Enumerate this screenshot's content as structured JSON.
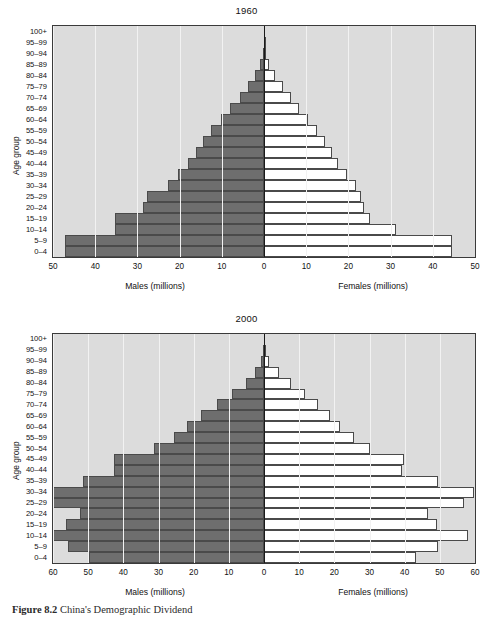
{
  "figure": {
    "caption_label": "Figure 8.2",
    "caption_text": "China's Demographic Dividend"
  },
  "axis_titles": {
    "y": "Age group",
    "males": "Males (millions)",
    "females": "Females (millions)"
  },
  "age_groups": [
    "100+",
    "95–99",
    "90–94",
    "85–89",
    "80–84",
    "75–79",
    "70–74",
    "65–69",
    "60–64",
    "55–59",
    "50–54",
    "45–49",
    "40–44",
    "35–39",
    "30–34",
    "25–29",
    "20–24",
    "15–19",
    "10–14",
    "5–9",
    "0–4"
  ],
  "colors": {
    "male_bar": "#6e6e6e",
    "female_bar": "#ffffff",
    "plot_background": "#dcdcdc",
    "gridline": "#f2f2f2",
    "axis": "#1a1a1a",
    "page_background": "#ffffff"
  },
  "chart_data": [
    {
      "type": "bar",
      "title": "1960",
      "xlabel": "",
      "ylabel": "Age group",
      "orientation": "population-pyramid",
      "grid": true,
      "legend": "none",
      "xlim": [
        -50,
        50
      ],
      "xticks": [
        50,
        40,
        30,
        20,
        10,
        0,
        10,
        20,
        30,
        40,
        50
      ],
      "xtick_values": [
        -50,
        -40,
        -30,
        -20,
        -10,
        0,
        10,
        20,
        30,
        40,
        50
      ],
      "categories": [
        "100+",
        "95–99",
        "90–94",
        "85–89",
        "80–84",
        "75–79",
        "70–74",
        "65–69",
        "60–64",
        "55–59",
        "50–54",
        "45–49",
        "40–44",
        "35–39",
        "30–34",
        "25–29",
        "20–24",
        "15–19",
        "10–14",
        "5–9",
        "0–4"
      ],
      "series": [
        {
          "name": "Males (millions)",
          "side": "left",
          "values": [
            0.0,
            0.1,
            0.3,
            0.9,
            2.1,
            3.8,
            5.8,
            8.0,
            10.3,
            12.6,
            14.5,
            16.2,
            18.0,
            20.4,
            22.8,
            27.7,
            28.6,
            35.3,
            35.3,
            47.2,
            47.2
          ]
        },
        {
          "name": "Females (millions)",
          "side": "right",
          "values": [
            0.0,
            0.1,
            0.4,
            1.2,
            2.6,
            4.4,
            6.3,
            8.3,
            10.4,
            12.5,
            14.4,
            16.0,
            17.5,
            19.6,
            21.8,
            23.0,
            23.7,
            25.0,
            31.3,
            44.6,
            44.6
          ]
        }
      ]
    },
    {
      "type": "bar",
      "title": "2000",
      "xlabel": "",
      "ylabel": "Age group",
      "orientation": "population-pyramid",
      "grid": true,
      "legend": "none",
      "xlim": [
        -60,
        60
      ],
      "xticks": [
        60,
        50,
        40,
        30,
        20,
        10,
        0,
        10,
        20,
        30,
        40,
        50,
        60
      ],
      "xtick_values": [
        -60,
        -50,
        -40,
        -30,
        -20,
        -10,
        0,
        10,
        20,
        30,
        40,
        50,
        60
      ],
      "categories": [
        "100+",
        "95–99",
        "90–94",
        "85–89",
        "80–84",
        "75–79",
        "70–74",
        "65–69",
        "60–64",
        "55–59",
        "50–54",
        "45–49",
        "40–44",
        "35–39",
        "30–34",
        "25–29",
        "20–24",
        "15–19",
        "10–14",
        "5–9",
        "0–4"
      ],
      "series": [
        {
          "name": "Males (millions)",
          "side": "left",
          "values": [
            0.0,
            0.2,
            0.9,
            2.6,
            5.2,
            9.0,
            13.4,
            17.8,
            21.8,
            25.7,
            31.4,
            42.6,
            42.6,
            51.6,
            63.3,
            60.0,
            52.4,
            56.4,
            64.0,
            55.8,
            49.8
          ]
        },
        {
          "name": "Females (millions)",
          "side": "right",
          "values": [
            0.0,
            0.3,
            1.4,
            4.2,
            7.6,
            11.6,
            15.4,
            18.7,
            21.7,
            25.5,
            30.2,
            39.8,
            39.2,
            49.4,
            59.7,
            57.0,
            46.5,
            49.1,
            58.0,
            49.4,
            43.3
          ]
        }
      ]
    }
  ]
}
